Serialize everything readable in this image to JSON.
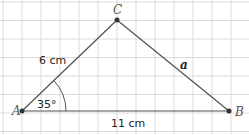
{
  "diagram": {
    "type": "triangle",
    "vertices": [
      {
        "name": "A",
        "x": 22,
        "y": 111,
        "label_x": 12,
        "label_y": 115
      },
      {
        "name": "B",
        "x": 229,
        "y": 111,
        "label_x": 235,
        "label_y": 116
      },
      {
        "name": "C",
        "x": 117,
        "y": 20,
        "label_x": 113,
        "label_y": 14
      }
    ],
    "labels": {
      "side_AC": "6 cm",
      "side_AB": "11 cm",
      "side_BC": "a",
      "angle_A": "35°"
    },
    "label_positions": {
      "side_AC": {
        "x": 39,
        "y": 64
      },
      "side_AB": {
        "x": 111,
        "y": 127
      },
      "side_BC": {
        "x": 180,
        "y": 69
      },
      "angle_A": {
        "x": 37,
        "y": 108
      }
    },
    "angle_arc": {
      "radius": 44,
      "degrees": 35
    },
    "grid": {
      "x_start": 3,
      "x_step": 19,
      "y_start": 2,
      "y_step": 18.5,
      "color": "#dcdcdc"
    },
    "colors": {
      "line": "#505050",
      "point": "#333333",
      "grid": "#dcdcdc"
    }
  }
}
